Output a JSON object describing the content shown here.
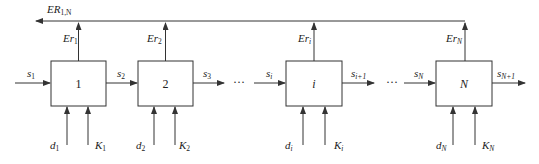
{
  "diagram": {
    "type": "serial-stage-block-diagram",
    "feedback_output": {
      "label": "ER",
      "subscript": "1,N"
    },
    "ellipsis": "···",
    "stages": [
      {
        "id": "1",
        "label": "1",
        "italic": false,
        "output_up": {
          "label": "Er",
          "sub": "1"
        },
        "inputs_bottom": [
          {
            "label": "d",
            "sub": "1"
          },
          {
            "label": "K",
            "sub": "1"
          }
        ]
      },
      {
        "id": "2",
        "label": "2",
        "italic": false,
        "output_up": {
          "label": "Er",
          "sub": "2"
        },
        "inputs_bottom": [
          {
            "label": "d",
            "sub": "2"
          },
          {
            "label": "K",
            "sub": "2"
          }
        ]
      },
      {
        "id": "i",
        "label": "i",
        "italic": true,
        "output_up": {
          "label": "Er",
          "sub": "i"
        },
        "inputs_bottom": [
          {
            "label": "d",
            "sub": "i"
          },
          {
            "label": "K",
            "sub": "i"
          }
        ]
      },
      {
        "id": "N",
        "label": "N",
        "italic": true,
        "output_up": {
          "label": "Er",
          "sub": "N"
        },
        "inputs_bottom": [
          {
            "label": "d",
            "sub": "N"
          },
          {
            "label": "K",
            "sub": "N"
          }
        ]
      }
    ],
    "flow_signals": [
      {
        "label": "s",
        "sub": "1"
      },
      {
        "label": "s",
        "sub": "2"
      },
      {
        "label": "s",
        "sub": "3"
      },
      {
        "label": "s",
        "sub": "i"
      },
      {
        "label": "s",
        "sub": "i+1"
      },
      {
        "label": "s",
        "sub": "N"
      },
      {
        "label": "s",
        "sub": "N+1"
      }
    ]
  }
}
